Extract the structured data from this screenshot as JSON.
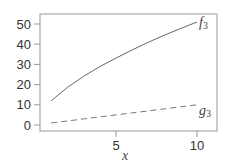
{
  "chart_data": {
    "type": "line",
    "title": "",
    "xlabel": "x",
    "ylabel": "",
    "xlim": [
      0.3,
      11.3
    ],
    "ylim": [
      -2,
      56
    ],
    "grid": false,
    "legend": "inline labels at line ends",
    "x_ticks": [
      5,
      10
    ],
    "y_ticks": [
      0,
      10,
      20,
      30,
      40,
      50
    ],
    "x": [
      1,
      2,
      3,
      4,
      5,
      6,
      7,
      8,
      9,
      10
    ],
    "series": [
      {
        "name": "f3",
        "label": "f",
        "subscript": "3",
        "style": "solid",
        "color": "#666666",
        "values": [
          12,
          18.6,
          24.1,
          28.9,
          33.1,
          37.2,
          41.0,
          44.5,
          47.8,
          51
        ]
      },
      {
        "name": "g3",
        "label": "g",
        "subscript": "3",
        "style": "dashed",
        "color": "#777777",
        "values": [
          1,
          2,
          3,
          4,
          5,
          6,
          7,
          8,
          9,
          10
        ]
      }
    ]
  }
}
